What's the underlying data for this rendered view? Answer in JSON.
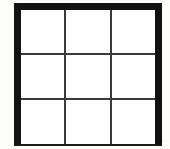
{
  "figure": {
    "name": "three-by-three-grid",
    "rows": 3,
    "columns": 3,
    "cell_count": 9,
    "background_color": "#ffffff",
    "page_color": "#fdfdfc",
    "frame": {
      "color": "#121212",
      "top_thickness_px": 7,
      "left_thickness_px": 7,
      "right_thickness_px": 7,
      "bottom_thickness_px": 2,
      "left_px": 14,
      "top_px": 3,
      "width_px": 148,
      "height_px": 143
    },
    "grid_lines": {
      "color": "#3a3a3a",
      "thickness_px": 2,
      "vertical_positions_px": [
        64,
        110
      ],
      "horizontal_positions_px": [
        53,
        98
      ]
    },
    "cells": [
      {
        "id": "cell-r1c1",
        "row": 1,
        "column": 1,
        "label": "",
        "fill": "#ffffff"
      },
      {
        "id": "cell-r1c2",
        "row": 1,
        "column": 2,
        "label": "",
        "fill": "#ffffff"
      },
      {
        "id": "cell-r1c3",
        "row": 1,
        "column": 3,
        "label": "",
        "fill": "#ffffff"
      },
      {
        "id": "cell-r2c1",
        "row": 2,
        "column": 1,
        "label": "",
        "fill": "#ffffff"
      },
      {
        "id": "cell-r2c2",
        "row": 2,
        "column": 2,
        "label": "",
        "fill": "#ffffff"
      },
      {
        "id": "cell-r2c3",
        "row": 2,
        "column": 3,
        "label": "",
        "fill": "#ffffff"
      },
      {
        "id": "cell-r3c1",
        "row": 3,
        "column": 1,
        "label": "",
        "fill": "#ffffff"
      },
      {
        "id": "cell-r3c2",
        "row": 3,
        "column": 2,
        "label": "",
        "fill": "#ffffff"
      },
      {
        "id": "cell-r3c3",
        "row": 3,
        "column": 3,
        "label": "",
        "fill": "#ffffff"
      }
    ]
  }
}
